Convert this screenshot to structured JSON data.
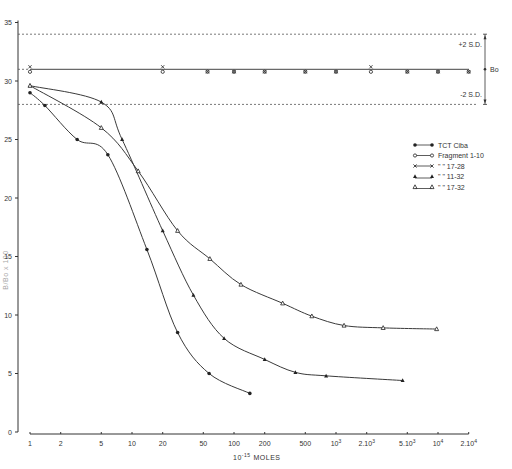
{
  "chart_data": {
    "type": "line",
    "title": "",
    "xlabel": "10^-15 MOLES",
    "xlabel_prefix": "10",
    "xlabel_exp": "-15",
    "xlabel_unit": "MOLES",
    "ylabel": "B/Bo x 100",
    "xscale": "log",
    "xlim": [
      1,
      20000
    ],
    "ylim": [
      0,
      35
    ],
    "y_ticks": [
      0,
      5,
      10,
      15,
      20,
      25,
      30,
      35
    ],
    "x_ticks": [
      {
        "value": 1,
        "label": "1"
      },
      {
        "value": 2,
        "label": "2"
      },
      {
        "value": 5,
        "label": "5"
      },
      {
        "value": 10,
        "label": "10"
      },
      {
        "value": 20,
        "label": "20"
      },
      {
        "value": 50,
        "label": "50"
      },
      {
        "value": 100,
        "label": "100"
      },
      {
        "value": 200,
        "label": "200"
      },
      {
        "value": 500,
        "label": "500"
      },
      {
        "value": 1000,
        "label": "10",
        "exp": "3"
      },
      {
        "value": 2000,
        "label": "2.10",
        "exp": "3"
      },
      {
        "value": 5000,
        "label": "5.10",
        "exp": "3"
      },
      {
        "value": 10000,
        "label": "10",
        "exp": "4"
      },
      {
        "value": 20000,
        "label": "2.10",
        "exp": "4"
      }
    ],
    "reference_lines": [
      {
        "name": "+2 S.D.",
        "y": 34.0,
        "style": "dashed"
      },
      {
        "name": "Bo",
        "y": 31.0,
        "style": "solid"
      },
      {
        "name": "-2 S.D.",
        "y": 28.0,
        "style": "dashed"
      }
    ],
    "annotations": {
      "plus_sd": "+2 S.D.",
      "bo": "Bo",
      "minus_sd": "-2 S.D."
    },
    "legend_position": "right",
    "legend": [
      {
        "label": "TCT Ciba",
        "marker": "filled-circle"
      },
      {
        "label": "Fragment   1-10",
        "marker": "open-circle"
      },
      {
        "label": "\"    \"    17-28",
        "marker": "x"
      },
      {
        "label": "\"    \"    11-32",
        "marker": "filled-triangle"
      },
      {
        "label": "\"    \"    17-32",
        "marker": "open-triangle"
      }
    ],
    "series": [
      {
        "name": "TCT Ciba",
        "marker": "filled-circle",
        "x": [
          1,
          1.4,
          2.9,
          5.8,
          14,
          28,
          57,
          143
        ],
        "y": [
          29.0,
          27.9,
          25.0,
          23.7,
          15.6,
          8.5,
          5.0,
          3.3
        ]
      },
      {
        "name": "Fragment 1-10",
        "marker": "open-circle",
        "x": [
          1,
          20,
          55,
          100,
          200,
          500,
          1000,
          2200,
          5000,
          10000,
          20000
        ],
        "y": [
          30.6,
          30.6,
          30.4,
          30.7,
          30.5,
          30.6,
          30.8,
          30.6,
          30.9,
          30.9,
          30.9
        ]
      },
      {
        "name": "Fragment 17-28",
        "marker": "x",
        "x": [
          1,
          20,
          55,
          100,
          200,
          500,
          1000,
          2200,
          5000,
          10000,
          20000
        ],
        "y": [
          31.5,
          31.1,
          30.9,
          30.5,
          30.9,
          30.3,
          30.4,
          31.2,
          30.5,
          30.5,
          30.6
        ]
      },
      {
        "name": "Fragment 11-32",
        "marker": "filled-triangle",
        "x": [
          1,
          5,
          8,
          20,
          40,
          80,
          200,
          400,
          800,
          4500
        ],
        "y": [
          29.6,
          28.2,
          25.0,
          17.2,
          11.7,
          8.0,
          6.2,
          5.1,
          4.8,
          4.4
        ]
      },
      {
        "name": "Fragment 17-32",
        "marker": "open-triangle",
        "x": [
          1,
          5,
          11.5,
          28,
          58,
          117,
          300,
          580,
          1200,
          2900,
          9700
        ],
        "y": [
          29.6,
          26.0,
          22.3,
          17.2,
          14.8,
          12.6,
          11.0,
          9.9,
          9.1,
          8.9,
          8.8
        ]
      }
    ]
  }
}
